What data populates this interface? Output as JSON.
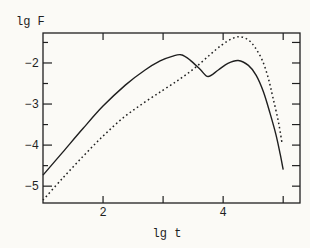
{
  "figure": {
    "background": "#fbfaf6",
    "line_color": "#1f1f1f"
  },
  "chart_data": {
    "type": "line",
    "title": "",
    "xlabel": "lg t",
    "ylabel": "lg F",
    "xlim": [
      1.0,
      5.28
    ],
    "ylim": [
      -5.41,
      -1.27
    ],
    "grid": false,
    "legend": "none",
    "x_ticks": [
      2,
      3,
      4,
      5
    ],
    "x_tick_labels": [
      {
        "value": 2,
        "label": "2"
      },
      {
        "value": 4,
        "label": "4"
      }
    ],
    "y_ticks_major": [
      -2,
      -3,
      -4,
      -5
    ],
    "y_ticks_minor": [
      -1.5,
      -2.5,
      -3.5,
      -4.5
    ],
    "y_tick_labels": [
      {
        "value": -2,
        "label": "−2"
      },
      {
        "value": -3,
        "label": "−3"
      },
      {
        "value": -4,
        "label": "−4"
      },
      {
        "value": -5,
        "label": "−5"
      }
    ],
    "series": [
      {
        "name": "solid-curve",
        "line_style": "solid",
        "color": "#1f1f1f",
        "points": [
          [
            1.0,
            -4.73
          ],
          [
            1.33,
            -4.17
          ],
          [
            1.67,
            -3.59
          ],
          [
            2.0,
            -3.05
          ],
          [
            2.37,
            -2.54
          ],
          [
            2.7,
            -2.17
          ],
          [
            2.95,
            -1.95
          ],
          [
            3.15,
            -1.84
          ],
          [
            3.3,
            -1.8
          ],
          [
            3.45,
            -1.93
          ],
          [
            3.62,
            -2.16
          ],
          [
            3.75,
            -2.33
          ],
          [
            3.92,
            -2.17
          ],
          [
            4.08,
            -2.01
          ],
          [
            4.25,
            -1.94
          ],
          [
            4.42,
            -2.06
          ],
          [
            4.55,
            -2.3
          ],
          [
            4.67,
            -2.7
          ],
          [
            4.78,
            -3.22
          ],
          [
            4.88,
            -3.75
          ],
          [
            4.95,
            -4.22
          ],
          [
            5.0,
            -4.6
          ]
        ]
      },
      {
        "name": "dotted-curve",
        "line_style": "dotted",
        "color": "#1f1f1f",
        "points": [
          [
            1.0,
            -5.34
          ],
          [
            1.33,
            -4.8
          ],
          [
            1.67,
            -4.27
          ],
          [
            2.0,
            -3.78
          ],
          [
            2.33,
            -3.34
          ],
          [
            2.67,
            -2.98
          ],
          [
            3.0,
            -2.66
          ],
          [
            3.28,
            -2.39
          ],
          [
            3.53,
            -2.12
          ],
          [
            3.78,
            -1.8
          ],
          [
            3.98,
            -1.56
          ],
          [
            4.15,
            -1.41
          ],
          [
            4.28,
            -1.36
          ],
          [
            4.42,
            -1.44
          ],
          [
            4.53,
            -1.62
          ],
          [
            4.65,
            -1.93
          ],
          [
            4.75,
            -2.36
          ],
          [
            4.83,
            -2.85
          ],
          [
            4.92,
            -3.43
          ],
          [
            4.98,
            -3.95
          ]
        ]
      }
    ]
  }
}
